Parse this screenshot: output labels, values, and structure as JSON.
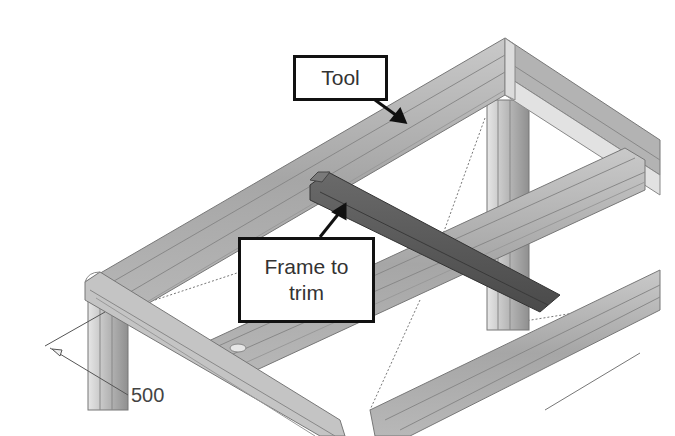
{
  "diagram": {
    "type": "isometric-cad-frame",
    "colors": {
      "frame_member": "#a9a9a9",
      "frame_highlight": "#d4d4d4",
      "trim_member": "#5a5a5a",
      "callout_border": "#111111",
      "background": "#ffffff"
    }
  },
  "callouts": {
    "tool": {
      "label": "Tool"
    },
    "frame_to_trim": {
      "line1": "Frame to",
      "line2": "trim"
    }
  },
  "dimension": {
    "value": "500"
  }
}
